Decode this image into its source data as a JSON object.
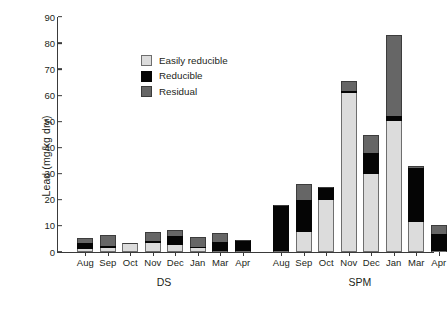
{
  "chart_data": {
    "type": "bar",
    "stacked": true,
    "title": "",
    "xlabel": "",
    "ylabel": "Lead (mg/kg dry)",
    "ylim": [
      0,
      90
    ],
    "ytick_step": 10,
    "yticks": [
      0,
      10,
      20,
      30,
      40,
      50,
      60,
      70,
      80,
      90
    ],
    "ytick_labels": [
      "0",
      "10",
      "20",
      "30",
      "40",
      "50",
      "60",
      "70",
      "80",
      "90"
    ],
    "grid": false,
    "legend_position": "upper-left-inside",
    "legend": [
      {
        "name": "Easily reducible",
        "color": "#dcdcdc",
        "key": "easily"
      },
      {
        "name": "Reducible",
        "color": "#050505",
        "key": "reducible"
      },
      {
        "name": "Residual",
        "color": "#666666",
        "key": "residual"
      }
    ],
    "groups": [
      {
        "name": "DS",
        "categories": [
          "Aug",
          "Sep",
          "Oct",
          "Nov",
          "Dec",
          "Jan",
          "Mar",
          "Apr"
        ],
        "series": [
          {
            "name": "Easily reducible",
            "key": "easily",
            "values": [
              1.0,
              1.7,
              3.3,
              3.3,
              2.5,
              1.5,
              0.0,
              0.0
            ]
          },
          {
            "name": "Reducible",
            "key": "reducible",
            "values": [
              2.6,
              0.6,
              0.0,
              0.8,
              3.7,
              0.6,
              4.0,
              4.6
            ]
          },
          {
            "name": "Residual",
            "key": "residual",
            "values": [
              1.7,
              4.3,
              0.0,
              3.7,
              2.2,
              3.7,
              3.3,
              0.0
            ]
          }
        ],
        "totals": [
          5.3,
          6.6,
          3.3,
          7.8,
          8.4,
          5.8,
          7.3,
          4.6
        ]
      },
      {
        "name": "SPM",
        "categories": [
          "Aug",
          "Sep",
          "Oct",
          "Nov",
          "Dec",
          "Jan",
          "Mar",
          "Apr"
        ],
        "series": [
          {
            "name": "Easily reducible",
            "key": "easily",
            "values": [
              0.0,
              7.5,
              20.0,
              61.0,
              30.0,
              50.0,
              11.5,
              0.0
            ]
          },
          {
            "name": "Reducible",
            "key": "reducible",
            "values": [
              18.0,
              12.5,
              5.0,
              0.7,
              8.0,
              2.0,
              20.5,
              7.0
            ]
          },
          {
            "name": "Residual",
            "key": "residual",
            "values": [
              0.0,
              6.0,
              0.0,
              3.8,
              7.0,
              31.0,
              1.0,
              3.5
            ]
          }
        ],
        "totals": [
          18.0,
          26.0,
          25.0,
          65.5,
          45.0,
          83.0,
          33.0,
          10.5
        ]
      }
    ]
  }
}
